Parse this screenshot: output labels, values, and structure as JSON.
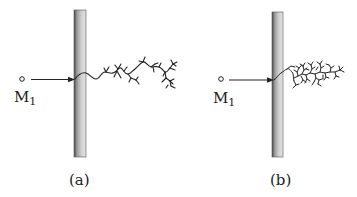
{
  "panels": [
    {
      "id": "a",
      "caption": "(a)",
      "source_label": "M",
      "source_subscript": "1",
      "description": "sparse tree growth"
    },
    {
      "id": "b",
      "caption": "(b)",
      "source_label": "M",
      "source_subscript": "1",
      "description": "dense tree growth"
    }
  ],
  "colors": {
    "ink": "#222222",
    "wall_dark": "#555555",
    "wall_light": "#d8d8d8"
  }
}
